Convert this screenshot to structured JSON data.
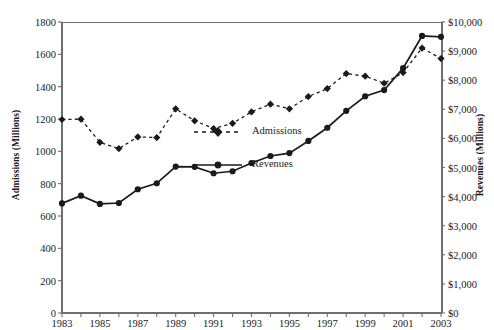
{
  "chart_data": {
    "type": "line",
    "title": "",
    "xlabel": "",
    "ylabel": "Admissions (Millions)",
    "y2label": "Revenues (Millions)",
    "grid": false,
    "legend_position": "center",
    "x": [
      1983,
      1984,
      1985,
      1986,
      1987,
      1988,
      1989,
      1990,
      1991,
      1992,
      1993,
      1994,
      1995,
      1996,
      1997,
      1998,
      1999,
      2000,
      2001,
      2002,
      2003
    ],
    "xlim": [
      1983,
      2003
    ],
    "xtick_labels": [
      "1983",
      "1985",
      "1987",
      "1989",
      "1991",
      "1993",
      "1995",
      "1997",
      "1999",
      "2001",
      "2003"
    ],
    "xtick_values": [
      1983,
      1985,
      1987,
      1989,
      1991,
      1993,
      1995,
      1997,
      1999,
      2001,
      2003
    ],
    "ylim": [
      0,
      1800
    ],
    "ytick_labels": [
      "0",
      "200",
      "400",
      "600",
      "800",
      "1000",
      "1200",
      "1400",
      "1600",
      "1800"
    ],
    "ytick_values": [
      0,
      200,
      400,
      600,
      800,
      1000,
      1200,
      1400,
      1600,
      1800
    ],
    "y2lim": [
      0,
      10000
    ],
    "y2tick_labels": [
      "$0",
      "$1,000",
      "$2,000",
      "$3,000",
      "$4,000",
      "$5,000",
      "$6,000",
      "$7,000",
      "$8,000",
      "$9,000",
      "$10,000"
    ],
    "y2tick_values": [
      0,
      1000,
      2000,
      3000,
      4000,
      5000,
      6000,
      7000,
      8000,
      9000,
      10000
    ],
    "series": [
      {
        "name": "Admissions",
        "axis": "left",
        "marker": "diamond",
        "linestyle": "dashed",
        "color": "#1a1a1a",
        "values": [
          1197,
          1199,
          1056,
          1017,
          1089,
          1085,
          1263,
          1189,
          1141,
          1173,
          1244,
          1292,
          1263,
          1339,
          1388,
          1481,
          1465,
          1421,
          1487,
          1639,
          1574
        ]
      },
      {
        "name": "Revenues",
        "axis": "right",
        "marker": "circle",
        "linestyle": "solid",
        "color": "#1a1a1a",
        "values": [
          3766,
          4031,
          3749,
          3780,
          4253,
          4458,
          5033,
          5022,
          4803,
          4871,
          5154,
          5396,
          5494,
          5912,
          6366,
          6949,
          7448,
          7661,
          8413,
          9520,
          9490
        ]
      }
    ]
  },
  "legend": {
    "entries": [
      {
        "label": "Admissions",
        "marker": "diamond",
        "linestyle": "dashed"
      },
      {
        "label": "Revenues",
        "marker": "circle",
        "linestyle": "solid"
      }
    ]
  },
  "colors": {
    "ink": "#1a1a1a",
    "axis": "#6f6f6f",
    "background": "#ffffff"
  }
}
